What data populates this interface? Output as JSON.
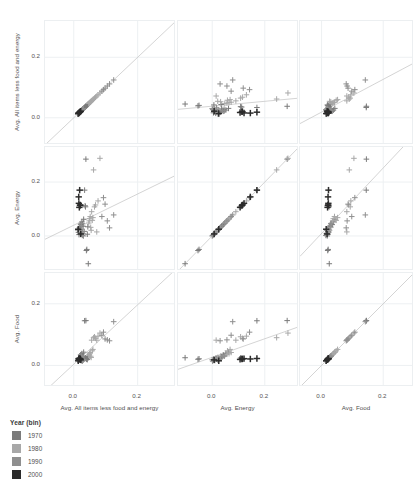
{
  "chart_data": {
    "type": "scatter",
    "title": "",
    "subtitle": "",
    "plot_kind": "scatter-plot-matrix",
    "marker": "plus",
    "grid": true,
    "legend_position": "bottom-left",
    "variables": [
      "Avg. All items less food and energy",
      "Avg. Energy",
      "Avg. Food"
    ],
    "axis_ranges": {
      "Avg. All items less food and energy": [
        -0.09,
        0.32
      ],
      "Avg. Energy": [
        -0.13,
        0.33
      ],
      "Avg. Food": [
        -0.07,
        0.3
      ]
    },
    "xlim": [
      -0.09,
      0.32
    ],
    "ylim": [
      -0.09,
      0.32
    ],
    "tick_labels": [
      "0.0",
      "0.2"
    ],
    "tick_values": [
      0.0,
      0.2
    ],
    "reference_line": "linear fit",
    "color_by": "Year (bin)",
    "legend": {
      "title": "Year (bin)",
      "entries": [
        {
          "label": "1970",
          "color": "#7b7b7b"
        },
        {
          "label": "1980",
          "color": "#a8a8a8"
        },
        {
          "label": "1990",
          "color": "#8f8f8f"
        },
        {
          "label": "2000",
          "color": "#2b2b2b"
        }
      ]
    },
    "points": [
      {
        "core": 0.0125,
        "energy": 0.022,
        "food": 0.0168,
        "bin": "1970"
      },
      {
        "core": 0.0148,
        "energy": 0.0135,
        "food": 0.023,
        "bin": "1970"
      },
      {
        "core": 0.0165,
        "energy": 0.005,
        "food": 0.0195,
        "bin": "1970"
      },
      {
        "core": 0.018,
        "energy": 0.0305,
        "food": 0.0255,
        "bin": "1970"
      },
      {
        "core": 0.02,
        "energy": 0.024,
        "food": 0.021,
        "bin": "1970"
      },
      {
        "core": 0.0215,
        "energy": 0.042,
        "food": 0.0345,
        "bin": "1970"
      },
      {
        "core": 0.024,
        "energy": 0.01,
        "food": 0.016,
        "bin": "1970"
      },
      {
        "core": 0.0255,
        "energy": 0.052,
        "food": 0.0385,
        "bin": "1970"
      },
      {
        "core": 0.0268,
        "energy": 0.002,
        "food": 0.014,
        "bin": "1970"
      },
      {
        "core": 0.028,
        "energy": 0.045,
        "food": 0.03,
        "bin": "1970"
      },
      {
        "core": 0.0295,
        "energy": 0.036,
        "food": 0.0275,
        "bin": "1970"
      },
      {
        "core": 0.031,
        "energy": 0.062,
        "food": 0.043,
        "bin": "1970"
      },
      {
        "core": 0.0325,
        "energy": 0.017,
        "food": 0.0225,
        "bin": "1970"
      },
      {
        "core": 0.034,
        "energy": 0.17,
        "food": 0.145,
        "bin": "1970"
      },
      {
        "core": 0.0355,
        "energy": 0.112,
        "food": 0.0235,
        "bin": "1970"
      },
      {
        "core": 0.0368,
        "energy": 0.108,
        "food": 0.0245,
        "bin": "1970"
      },
      {
        "core": 0.038,
        "energy": 0.285,
        "food": 0.1455,
        "bin": "1970"
      },
      {
        "core": 0.0395,
        "energy": -0.054,
        "food": 0.02,
        "bin": "1970"
      },
      {
        "core": 0.041,
        "energy": -0.05,
        "food": 0.0215,
        "bin": "1970"
      },
      {
        "core": 0.0425,
        "energy": 0.0065,
        "food": 0.019,
        "bin": "1970"
      },
      {
        "core": 0.044,
        "energy": 0.034,
        "food": 0.029,
        "bin": "1970"
      },
      {
        "core": 0.0455,
        "energy": -0.103,
        "food": 0.025,
        "bin": "1970"
      },
      {
        "core": 0.047,
        "energy": 0.048,
        "food": 0.033,
        "bin": "1980"
      },
      {
        "core": 0.0485,
        "energy": 0.056,
        "food": 0.036,
        "bin": "1980"
      },
      {
        "core": 0.05,
        "energy": 0.064,
        "food": 0.038,
        "bin": "1980"
      },
      {
        "core": 0.0515,
        "energy": 0.072,
        "food": 0.042,
        "bin": "1980"
      },
      {
        "core": 0.053,
        "energy": 0.032,
        "food": 0.03,
        "bin": "1980"
      },
      {
        "core": 0.0545,
        "energy": 0.021,
        "food": 0.026,
        "bin": "1980"
      },
      {
        "core": 0.056,
        "energy": 0.09,
        "food": 0.082,
        "bin": "1980"
      },
      {
        "core": 0.058,
        "energy": 0.058,
        "food": 0.0475,
        "bin": "1980"
      },
      {
        "core": 0.06,
        "energy": 0.068,
        "food": 0.052,
        "bin": "1980"
      },
      {
        "core": 0.062,
        "energy": 0.245,
        "food": 0.09,
        "bin": "1980"
      },
      {
        "core": 0.065,
        "energy": 0.108,
        "food": 0.093,
        "bin": "1980"
      },
      {
        "core": 0.068,
        "energy": 0.115,
        "food": 0.088,
        "bin": "1980"
      },
      {
        "core": 0.072,
        "energy": 0.015,
        "food": 0.082,
        "bin": "1980"
      },
      {
        "core": 0.076,
        "energy": 0.13,
        "food": 0.095,
        "bin": "1980"
      },
      {
        "core": 0.082,
        "energy": 0.288,
        "food": 0.105,
        "bin": "1980"
      },
      {
        "core": 0.088,
        "energy": 0.072,
        "food": 0.098,
        "bin": "1990"
      },
      {
        "core": 0.093,
        "energy": 0.142,
        "food": 0.108,
        "bin": "1990"
      },
      {
        "core": 0.098,
        "energy": 0.118,
        "food": 0.086,
        "bin": "1990"
      },
      {
        "core": 0.105,
        "energy": 0.056,
        "food": 0.083,
        "bin": "1990"
      },
      {
        "core": 0.112,
        "energy": 0.03,
        "food": 0.08,
        "bin": "1990"
      },
      {
        "core": 0.125,
        "energy": 0.078,
        "food": 0.142,
        "bin": "1990"
      },
      {
        "core": 0.0305,
        "energy": 0.0,
        "food": 0.0185,
        "bin": "1990"
      },
      {
        "core": 0.029,
        "energy": 0.0085,
        "food": 0.017,
        "bin": "1990"
      },
      {
        "core": 0.0275,
        "energy": 0.0155,
        "food": 0.0205,
        "bin": "1990"
      },
      {
        "core": 0.026,
        "energy": 0.023,
        "food": 0.024,
        "bin": "1990"
      },
      {
        "core": 0.0245,
        "energy": 0.039,
        "food": 0.0285,
        "bin": "1990"
      },
      {
        "core": 0.023,
        "energy": 0.0465,
        "food": 0.031,
        "bin": "1990"
      },
      {
        "core": 0.0218,
        "energy": 0.0075,
        "food": 0.018,
        "bin": "2000"
      },
      {
        "core": 0.0205,
        "energy": 0.115,
        "food": 0.0215,
        "bin": "2000"
      },
      {
        "core": 0.0195,
        "energy": 0.113,
        "food": 0.0205,
        "bin": "2000"
      },
      {
        "core": 0.0185,
        "energy": 0.17,
        "food": 0.0225,
        "bin": "2000"
      },
      {
        "core": 0.0175,
        "energy": 0.106,
        "food": 0.0195,
        "bin": "2000"
      },
      {
        "core": 0.016,
        "energy": 0.121,
        "food": 0.022,
        "bin": "2000"
      },
      {
        "core": 0.014,
        "energy": 0.025,
        "food": 0.015,
        "bin": "2000"
      },
      {
        "core": 0.0155,
        "energy": 0.145,
        "food": 0.021,
        "bin": "2000"
      }
    ]
  },
  "axes": {
    "rows": [
      {
        "title": "Avg. All items less food and energy",
        "ticks": [
          "0.2",
          "0.0"
        ]
      },
      {
        "title": "Avg. Energy",
        "ticks": [
          "0.2",
          "0.0"
        ]
      },
      {
        "title": "Avg. Food",
        "ticks": [
          "0.2",
          "0.0"
        ]
      }
    ],
    "cols": [
      {
        "title": "Avg. All items less food and energy",
        "ticks": [
          "0.0",
          "0.2"
        ]
      },
      {
        "title": "Avg. Energy",
        "ticks": [
          "0.0",
          "0.2"
        ]
      },
      {
        "title": "Avg. Food",
        "ticks": [
          "0.0",
          "0.2"
        ]
      }
    ]
  },
  "legend": {
    "title": "Year (bin)",
    "items": [
      {
        "label": "1970",
        "color": "#7b7b7b"
      },
      {
        "label": "1980",
        "color": "#a8a8a8"
      },
      {
        "label": "1990",
        "color": "#8f8f8f"
      },
      {
        "label": "2000",
        "color": "#2b2b2b"
      }
    ]
  },
  "style": {
    "background": "#ffffff",
    "panel_border": "#eceff1",
    "grid_color": "#edf0f2",
    "trend_line": "#c9c9c9",
    "text": "#4f4f4f"
  }
}
